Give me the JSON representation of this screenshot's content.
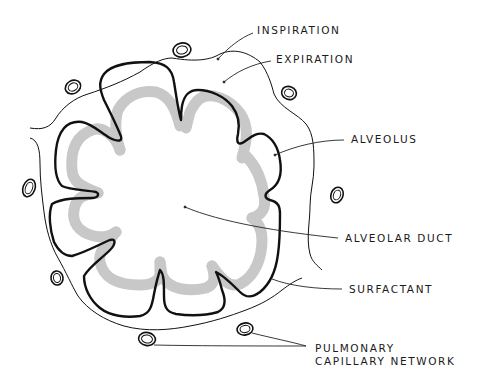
{
  "diagram": {
    "colors": {
      "background": "#ffffff",
      "outline": "#111111",
      "surfactant": "#c8c8c8",
      "leader": "#222222"
    },
    "labels": [
      {
        "id": "inspiration",
        "text": "INSPIRATION",
        "x": 257,
        "y": 24
      },
      {
        "id": "expiration",
        "text": "EXPIRATION",
        "x": 276,
        "y": 53
      },
      {
        "id": "alveolus",
        "text": "ALVEOLUS",
        "x": 351,
        "y": 133
      },
      {
        "id": "alveolar-duct",
        "text": "ALVEOLAR DUCT",
        "x": 345,
        "y": 232
      },
      {
        "id": "surfactant",
        "text": "SURFACTANT",
        "x": 349,
        "y": 283
      },
      {
        "id": "pulmonary",
        "text": "PULMONARY",
        "x": 315,
        "y": 342
      },
      {
        "id": "capillary-network",
        "text": "CAPILLARY NETWORK",
        "x": 315,
        "y": 355
      }
    ],
    "structures": [
      "inspiration-outline",
      "expiration-outline",
      "surfactant-layer",
      "alveolus",
      "alveolar-duct",
      "pulmonary-capillaries"
    ],
    "capillaries": [
      {
        "cx": 182,
        "cy": 50,
        "rx": 9,
        "ry": 7,
        "rot": -10
      },
      {
        "cx": 73,
        "cy": 87,
        "rx": 8,
        "ry": 7,
        "rot": -30
      },
      {
        "cx": 289,
        "cy": 93,
        "rx": 8,
        "ry": 7,
        "rot": 20
      },
      {
        "cx": 29,
        "cy": 188,
        "rx": 6,
        "ry": 9,
        "rot": 20
      },
      {
        "cx": 337,
        "cy": 195,
        "rx": 6,
        "ry": 8,
        "rot": 20
      },
      {
        "cx": 57,
        "cy": 278,
        "rx": 6,
        "ry": 7,
        "rot": -10
      },
      {
        "cx": 147,
        "cy": 339,
        "rx": 8,
        "ry": 6,
        "rot": 10
      },
      {
        "cx": 245,
        "cy": 329,
        "rx": 8,
        "ry": 6,
        "rot": -10
      }
    ]
  }
}
